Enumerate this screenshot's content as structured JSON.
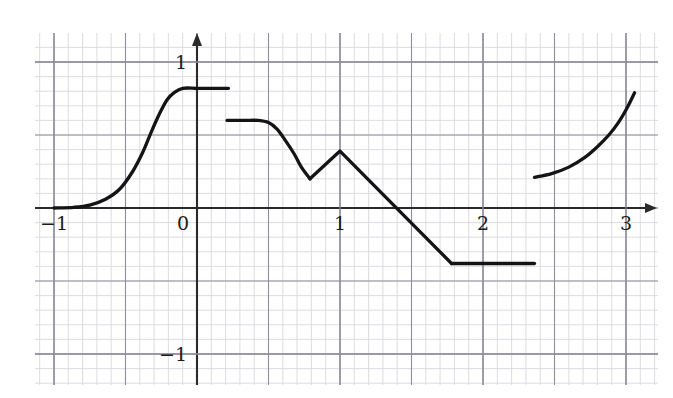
{
  "figure": {
    "background_color": "#ffffff",
    "grid_minor_color": "#d8d8e0",
    "grid_major_color": "#8e8e9c",
    "axis_color": "#2a2a2a",
    "curve_color": "#141414",
    "width": 673,
    "height": 398
  },
  "chart_data": {
    "type": "line",
    "title": "",
    "subtitle": "",
    "xlabel": "",
    "ylabel": "",
    "xlim": [
      -1.15,
      3.3
    ],
    "ylim": [
      -1.2,
      1.18
    ],
    "xticks": [
      -1,
      0,
      1,
      2,
      3
    ],
    "xtick_labels": [
      "−1",
      "0",
      "1",
      "2",
      "3"
    ],
    "yticks": [
      -1,
      1
    ],
    "ytick_labels": [
      "−1",
      "1"
    ],
    "grid": true,
    "grid_major_step": 0.5,
    "grid_minor_step": 0.1,
    "legend": "none",
    "axis_arrows": [
      "x-positive",
      "y-positive"
    ],
    "annotations": [],
    "series": [
      {
        "name": "sigmoid-rise",
        "kind": "smooth",
        "points": [
          [
            -1.0,
            0.0
          ],
          [
            -0.86,
            0.005
          ],
          [
            -0.75,
            0.02
          ],
          [
            -0.64,
            0.06
          ],
          [
            -0.54,
            0.13
          ],
          [
            -0.45,
            0.25
          ],
          [
            -0.38,
            0.38
          ],
          [
            -0.32,
            0.52
          ],
          [
            -0.26,
            0.65
          ],
          [
            -0.21,
            0.74
          ],
          [
            -0.16,
            0.79
          ],
          [
            -0.1,
            0.82
          ],
          [
            0.0,
            0.82
          ],
          [
            0.11,
            0.82
          ],
          [
            0.22,
            0.82
          ]
        ]
      },
      {
        "name": "plateau-and-dip",
        "kind": "smooth",
        "points": [
          [
            0.21,
            0.6
          ],
          [
            0.33,
            0.6
          ],
          [
            0.43,
            0.6
          ],
          [
            0.5,
            0.585
          ],
          [
            0.56,
            0.54
          ],
          [
            0.62,
            0.46
          ],
          [
            0.68,
            0.37
          ],
          [
            0.73,
            0.28
          ],
          [
            0.79,
            0.2
          ]
        ]
      },
      {
        "name": "peak-and-decline",
        "kind": "linear",
        "points": [
          [
            0.79,
            0.2
          ],
          [
            1.0,
            0.39
          ],
          [
            1.78,
            -0.38
          ]
        ]
      },
      {
        "name": "floor",
        "kind": "linear",
        "points": [
          [
            1.78,
            -0.38
          ],
          [
            2.36,
            -0.38
          ]
        ]
      },
      {
        "name": "exponential-rise",
        "kind": "smooth",
        "points": [
          [
            2.36,
            0.21
          ],
          [
            2.48,
            0.235
          ],
          [
            2.6,
            0.28
          ],
          [
            2.71,
            0.345
          ],
          [
            2.8,
            0.42
          ],
          [
            2.88,
            0.5
          ],
          [
            2.95,
            0.59
          ],
          [
            3.01,
            0.69
          ],
          [
            3.06,
            0.79
          ]
        ]
      }
    ]
  }
}
